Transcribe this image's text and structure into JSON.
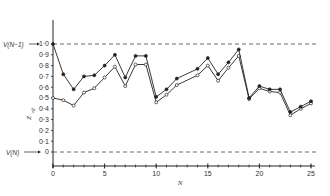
{
  "chart_data": {
    "type": "line",
    "title": "",
    "xlabel": "N",
    "ylabel": "Z_eff",
    "xlim": [
      0,
      25
    ],
    "ylim": [
      0,
      1.0
    ],
    "x_ticks": [
      0,
      5,
      10,
      15,
      20,
      25
    ],
    "x_tick_labels": [
      "0",
      "5",
      "10",
      "15",
      "20",
      "25"
    ],
    "y_ticks": [
      0,
      0.1,
      0.2,
      0.3,
      0.4,
      0.5,
      0.6,
      0.7,
      0.8,
      0.9,
      1.0
    ],
    "y_tick_labels": [
      "0",
      "0·1",
      "0·2",
      "0·3",
      "0·4",
      "0·5",
      "0·6",
      "0·7",
      "0·8",
      "0·9",
      "1·0"
    ],
    "grid": false,
    "legend": null,
    "reference_lines": [
      {
        "label": "V(N−1)",
        "y": 1.0,
        "style": "dashed"
      },
      {
        "label": "V(N)",
        "y": 0,
        "style": "dashed"
      }
    ],
    "x": [
      0,
      1,
      2,
      3,
      4,
      5,
      6,
      7,
      8,
      9,
      10,
      11,
      12,
      14,
      15,
      16,
      17,
      18,
      19,
      20,
      21,
      22,
      23,
      24,
      25
    ],
    "series": [
      {
        "name": "filled markers",
        "marker": "filled-circle",
        "values": [
          1.0,
          0.72,
          0.58,
          0.7,
          0.71,
          0.8,
          0.9,
          0.69,
          0.89,
          0.89,
          0.51,
          0.58,
          0.68,
          0.77,
          0.87,
          0.72,
          0.83,
          0.95,
          0.5,
          0.61,
          0.58,
          0.58,
          0.37,
          0.42,
          0.47
        ]
      },
      {
        "name": "open markers",
        "marker": "open-circle",
        "values": [
          0.5,
          0.48,
          0.43,
          0.55,
          0.59,
          0.69,
          0.79,
          0.61,
          0.81,
          0.81,
          0.46,
          0.53,
          0.62,
          0.71,
          0.8,
          0.66,
          0.78,
          0.89,
          0.49,
          0.59,
          0.56,
          0.55,
          0.34,
          0.4,
          0.45
        ]
      }
    ]
  },
  "labels": {
    "ref_upper": "V(N−1)",
    "ref_lower": "V(N)",
    "x_axis_title": "N",
    "y_axis_title": "Z",
    "y_axis_subscript": "eff"
  }
}
